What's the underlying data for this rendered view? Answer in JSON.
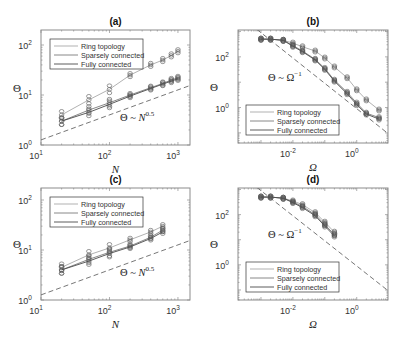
{
  "figure": {
    "panels": [
      {
        "label": "(a)",
        "xlabel": "N",
        "ylabel": "Θ",
        "annotation": "Θ ~ N",
        "annotation_exp": "0.5",
        "xticks": [
          "10",
          "10",
          "10"
        ],
        "xtick_exps": [
          "1",
          "2",
          "3"
        ],
        "yticks": [
          "10",
          "10",
          "10"
        ],
        "ytick_exps": [
          "0",
          "1",
          "2"
        ]
      },
      {
        "label": "(b)",
        "xlabel": "Ω",
        "ylabel": "Θ",
        "annotation": "Θ ~ Ω",
        "annotation_exp": "−1",
        "xticks": [
          "10",
          "10"
        ],
        "xtick_exps": [
          "-2",
          "0"
        ],
        "yticks": [
          "10",
          "10"
        ],
        "ytick_exps": [
          "0",
          "2"
        ]
      },
      {
        "label": "(c)",
        "xlabel": "N",
        "ylabel": "Θ",
        "annotation": "Θ ~ N",
        "annotation_exp": "0.5",
        "xticks": [
          "10",
          "10",
          "10"
        ],
        "xtick_exps": [
          "1",
          "2",
          "3"
        ],
        "yticks": [
          "10",
          "10",
          "10"
        ],
        "ytick_exps": [
          "0",
          "1",
          "2"
        ]
      },
      {
        "label": "(d)",
        "xlabel": "Ω",
        "ylabel": "Θ",
        "annotation": "Θ ~ Ω",
        "annotation_exp": "−1",
        "xticks": [
          "10",
          "10"
        ],
        "xtick_exps": [
          "-2",
          "0"
        ],
        "yticks": [
          "10",
          "10"
        ],
        "ytick_exps": [
          "0",
          "2"
        ]
      }
    ],
    "legend": [
      "Ring topology",
      "Sparsely connected",
      "Fully connected"
    ],
    "colors": {
      "ring": "#a8a8a8",
      "sparse": "#7a7a7a",
      "full": "#4a4a4a",
      "frame": "#8c8c8c",
      "dashed": "#666666"
    }
  },
  "chart_data": [
    {
      "type": "line",
      "title": "(a)",
      "xlabel": "N",
      "ylabel": "Θ",
      "xscale": "log",
      "yscale": "log",
      "xlim": [
        10,
        1500
      ],
      "ylim": [
        1,
        200
      ],
      "x": [
        20,
        50,
        100,
        200,
        400,
        600,
        800,
        1000
      ],
      "series": [
        {
          "name": "Ring topology",
          "values": [
            4,
            8,
            13,
            25,
            40,
            50,
            62,
            75
          ]
        },
        {
          "name": "Sparsely connected",
          "values": [
            3,
            5,
            7,
            10,
            14,
            17,
            20,
            22
          ]
        },
        {
          "name": "Fully connected",
          "values": [
            3,
            4.5,
            6.5,
            9.5,
            13.5,
            16.5,
            19,
            21
          ]
        },
        {
          "name": "Θ ~ N^0.5 (reference)",
          "values": [
            1.8,
            2.8,
            4,
            5.7,
            8,
            9.8,
            11.3,
            12.6
          ],
          "style": "dashed"
        }
      ]
    },
    {
      "type": "line",
      "title": "(b)",
      "xlabel": "Ω",
      "ylabel": "Θ",
      "xscale": "log",
      "yscale": "log",
      "xlim": [
        0.0003,
        10
      ],
      "ylim": [
        0.05,
        2000
      ],
      "x": [
        0.001,
        0.002,
        0.005,
        0.01,
        0.02,
        0.05,
        0.1,
        0.2,
        0.5,
        1,
        2,
        5
      ],
      "series": [
        {
          "name": "Ring topology",
          "values": [
            500,
            500,
            450,
            350,
            250,
            170,
            90,
            40,
            15,
            5,
            2,
            0.8
          ]
        },
        {
          "name": "Sparsely connected",
          "values": [
            500,
            500,
            450,
            280,
            170,
            80,
            35,
            12,
            4,
            1.5,
            0.6,
            0.4
          ]
        },
        {
          "name": "Fully connected",
          "values": [
            500,
            500,
            450,
            260,
            160,
            75,
            32,
            11,
            3.5,
            1.3,
            0.55,
            0.35
          ]
        },
        {
          "name": "Θ ~ Ω^-1 (reference)",
          "style": "dashed"
        }
      ]
    },
    {
      "type": "line",
      "title": "(c)",
      "xlabel": "N",
      "ylabel": "Θ",
      "xscale": "log",
      "yscale": "log",
      "xlim": [
        10,
        1500
      ],
      "ylim": [
        1,
        200
      ],
      "x": [
        20,
        50,
        100,
        200,
        400,
        600
      ],
      "series": [
        {
          "name": "Ring topology",
          "values": [
            4.5,
            8,
            11,
            16,
            23,
            30
          ]
        },
        {
          "name": "Sparsely connected",
          "values": [
            4,
            6.5,
            9,
            12,
            18,
            25
          ]
        },
        {
          "name": "Fully connected",
          "values": [
            4,
            6,
            8.5,
            11.5,
            17,
            23
          ]
        },
        {
          "name": "Θ ~ N^0.5 (reference)",
          "style": "dashed"
        }
      ]
    },
    {
      "type": "line",
      "title": "(d)",
      "xlabel": "Ω",
      "ylabel": "Θ",
      "xscale": "log",
      "yscale": "log",
      "xlim": [
        0.0003,
        10
      ],
      "ylim": [
        0.05,
        2000
      ],
      "x": [
        0.001,
        0.002,
        0.005,
        0.01,
        0.02,
        0.05,
        0.1,
        0.2
      ],
      "series": [
        {
          "name": "Ring topology",
          "values": [
            500,
            500,
            450,
            350,
            250,
            120,
            50,
            20
          ]
        },
        {
          "name": "Sparsely connected",
          "values": [
            500,
            500,
            450,
            320,
            210,
            100,
            40,
            16
          ]
        },
        {
          "name": "Fully connected",
          "values": [
            500,
            500,
            450,
            300,
            190,
            90,
            35,
            14
          ]
        },
        {
          "name": "Θ ~ Ω^-1 (reference)",
          "style": "dashed"
        }
      ]
    }
  ]
}
